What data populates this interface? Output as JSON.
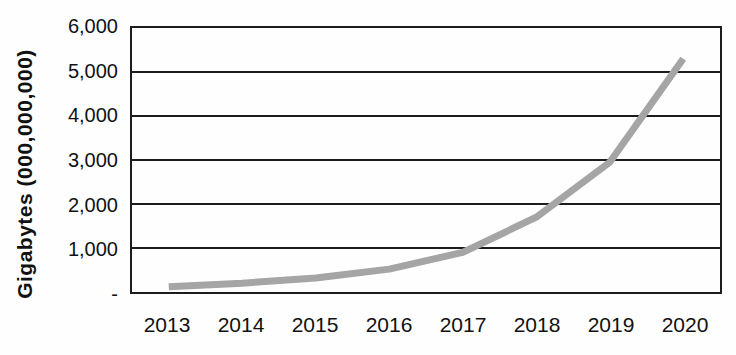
{
  "chart_data": {
    "type": "line",
    "title": "",
    "xlabel": "",
    "ylabel": "Gigabytes (000,000,000)",
    "categories": [
      "2013",
      "2014",
      "2015",
      "2016",
      "2017",
      "2018",
      "2019",
      "2020"
    ],
    "values": [
      120,
      200,
      320,
      520,
      900,
      1700,
      2950,
      5300
    ],
    "ylim": [
      0,
      6000
    ],
    "ytick_step": 1000,
    "ytick_labels": [
      "-",
      "1,000",
      "2,000",
      "3,000",
      "4,000",
      "5,000",
      "6,000"
    ],
    "grid": true,
    "legend": false,
    "line_color": "#a5a5a5",
    "line_width": 7,
    "grid_color": "#1c1c1c",
    "axis_text_color": "#111111"
  }
}
